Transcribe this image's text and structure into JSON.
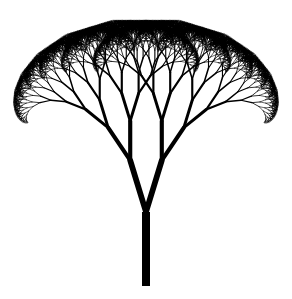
{
  "image": {
    "subject": "fractal tree",
    "width": 292,
    "height": 299,
    "background": "#ffffff",
    "stroke_color": "#000000"
  },
  "fractal": {
    "trunk_base": [
      146,
      286
    ],
    "trunk_length": 74,
    "trunk_width": 8,
    "branch_angle_deg": 17,
    "length_ratio": 0.73,
    "width_ratio": 0.72,
    "depth": 13,
    "min_width": 0.6
  }
}
